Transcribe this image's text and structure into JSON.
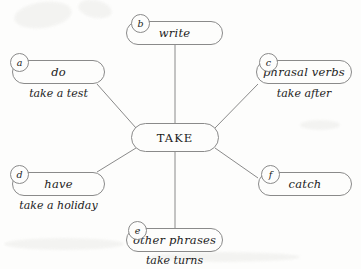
{
  "diagram": {
    "title": "TAKE",
    "center": {
      "label": "TAKE"
    },
    "branches": [
      {
        "badge": "a",
        "label": "do",
        "caption": "take a test"
      },
      {
        "badge": "b",
        "label": "write",
        "caption": ""
      },
      {
        "badge": "c",
        "label": "phrasal verbs",
        "caption": "take after"
      },
      {
        "badge": "d",
        "label": "have",
        "caption": "take a holiday"
      },
      {
        "badge": "e",
        "label": "other phrases",
        "caption": "take turns"
      },
      {
        "badge": "f",
        "label": "catch",
        "caption": ""
      }
    ],
    "colors": {
      "ink": "#1b1b1b",
      "stroke": "#8a8a8a",
      "paper": "#fdfdfc"
    }
  }
}
